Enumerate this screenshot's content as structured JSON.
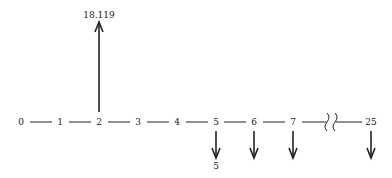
{
  "diagram": {
    "type": "cash-flow timeline",
    "periods": [
      {
        "label": "0",
        "x": 21
      },
      {
        "label": "1",
        "x": 60
      },
      {
        "label": "2",
        "x": 99
      },
      {
        "label": "3",
        "x": 138
      },
      {
        "label": "4",
        "x": 177
      },
      {
        "label": "5",
        "x": 216
      },
      {
        "label": "6",
        "x": 254
      },
      {
        "label": "7",
        "x": 293
      },
      {
        "label": "25",
        "x": 371
      }
    ],
    "inflow": {
      "period": "2",
      "value": "18.119"
    },
    "outflows": [
      {
        "period": "5",
        "value": "5"
      },
      {
        "period": "6",
        "value": ""
      },
      {
        "period": "7",
        "value": ""
      },
      {
        "period": "25",
        "value": ""
      }
    ],
    "break_between": [
      "7",
      "25"
    ]
  }
}
